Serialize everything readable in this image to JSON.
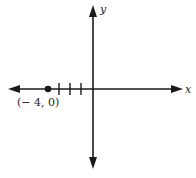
{
  "diagram": {
    "type": "coordinate-plane",
    "x_axis_label": "x",
    "y_axis_label": "y",
    "tick_marks_negative_x": [
      -3,
      -2,
      -1
    ],
    "point": {
      "x": -4,
      "y": 0,
      "label": "(− 4, 0)"
    },
    "colors": {
      "axis": "#1a1a1a",
      "background": "#ffffff"
    }
  }
}
